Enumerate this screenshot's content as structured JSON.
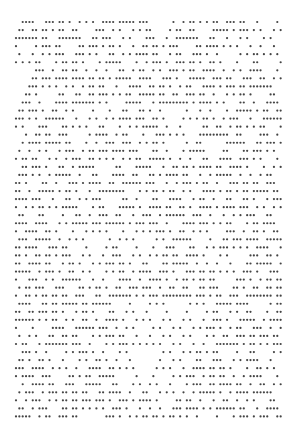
{
  "figure": {
    "rule": 90,
    "rows": 50,
    "columns": 80,
    "seed": 1337,
    "initial_density": 0.5,
    "dot_color": "#444444",
    "background_color": "#ffffff"
  }
}
